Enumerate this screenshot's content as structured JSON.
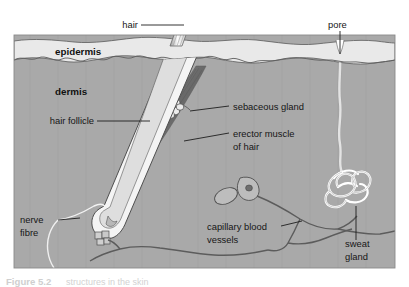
{
  "figure": {
    "caption_prefix": "Figure 5.2",
    "caption_rest": "structures in the skin",
    "background_color": "#ffffff"
  },
  "colors": {
    "epidermis_fill": "#e9e9e9",
    "dermis_fill": "#a9a9a9",
    "subcutaneous_fill": "#b4b4b4",
    "outline": "#4a4a4a",
    "hair_fill": "#f2f2f2",
    "muscle_fill": "#6a6a6a",
    "gland_fill": "#ffffff",
    "vessel_stroke": "#575757",
    "nerve_stroke": "#f4f4f4",
    "label_color": "#161616"
  },
  "layers": [
    {
      "id": "epidermis",
      "label": "epidermis",
      "x": 55,
      "y": 52,
      "bold": true
    },
    {
      "id": "dermis",
      "label": "dermis",
      "x": 55,
      "y": 92,
      "bold": true
    }
  ],
  "labels": [
    {
      "id": "hair",
      "text": "hair",
      "x": 135,
      "y": 28,
      "anchor": "end",
      "leader": "M 139,25 L 182,25"
    },
    {
      "id": "pore",
      "text": "pore",
      "x": 328,
      "y": 26,
      "anchor": "start",
      "leader": "M 340,31 L 340,54"
    },
    {
      "id": "sebaceous-gland",
      "text": "sebaceous gland",
      "x": 232,
      "y": 109,
      "anchor": "start",
      "leader": "M 229,106 L 192,113"
    },
    {
      "id": "erector-muscle-of-hair",
      "text": "erector muscle",
      "text2": "of hair",
      "x": 232,
      "y": 136,
      "y2": 149,
      "anchor": "start",
      "leader": "M 229,133 L 186,140"
    },
    {
      "id": "hair-follicle",
      "text": "hair follicle",
      "x": 93,
      "y": 124,
      "anchor": "end",
      "leader": "M 97,121 L 148,121"
    },
    {
      "id": "nerve-fibre",
      "text": "nerve",
      "text2": "fibre",
      "x": 20,
      "y": 223,
      "y2": 236,
      "anchor": "start",
      "leader": "M 57,220 L 80,220"
    },
    {
      "id": "capillary-blood-vessels",
      "text": "capillary blood",
      "text2": "vessels",
      "x": 207,
      "y": 229,
      "y2": 242,
      "anchor": "start",
      "leader": "M 278,226 L 300,226"
    },
    {
      "id": "sweat-gland",
      "text": "sweat",
      "text2": "gland",
      "x": 345,
      "y": 246,
      "y2": 259,
      "anchor": "start",
      "leader": "M 355,242 L 355,206"
    }
  ],
  "structures": [
    {
      "id": "hair-shaft",
      "name": "hair shaft"
    },
    {
      "id": "hair-follicle-shape",
      "name": "hair follicle"
    },
    {
      "id": "sebaceous-gland-shape",
      "name": "sebaceous gland"
    },
    {
      "id": "erector-muscle-shape",
      "name": "erector muscle of hair"
    },
    {
      "id": "sweat-gland-coil",
      "name": "sweat gland"
    },
    {
      "id": "sweat-duct",
      "name": "sweat duct"
    },
    {
      "id": "pore-opening",
      "name": "pore"
    },
    {
      "id": "capillary-network",
      "name": "capillary blood vessels"
    },
    {
      "id": "nerve-fibre-line",
      "name": "nerve fibre"
    },
    {
      "id": "sensory-receptor-a",
      "name": "sensory receptor"
    },
    {
      "id": "sensory-receptor-b",
      "name": "sensory receptor"
    }
  ]
}
